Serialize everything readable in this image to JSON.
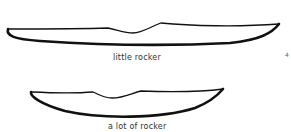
{
  "diagram": {
    "stroke_color": "#111111",
    "background": "#ffffff",
    "kayaks": [
      {
        "id": "little-rocker",
        "label": "little rocker"
      },
      {
        "id": "a-lot-of-rocker",
        "label": "a lot of rocker"
      }
    ],
    "page_mark": "4"
  }
}
